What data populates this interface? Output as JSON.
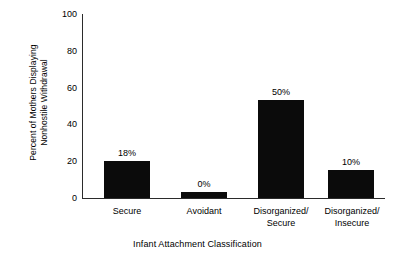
{
  "chart_data": {
    "type": "bar",
    "title": "",
    "xlabel": "Infant Attachment Classification",
    "ylabel": "Percent of Mothers Displaying Nonhostile Withdrawal",
    "ylabel_lines": [
      "Percent of Mothers Displaying",
      "Nonhostile Withdrawal"
    ],
    "categories": [
      "Secure",
      "Avoidant",
      "Disorganized/Secure",
      "Disorganized/Insecure"
    ],
    "category_lines": [
      [
        "Secure"
      ],
      [
        "Avoidant"
      ],
      [
        "Disorganized/",
        "Secure"
      ],
      [
        "Disorganized/",
        "Insecure"
      ]
    ],
    "values": [
      20,
      3,
      53,
      15
    ],
    "data_labels": [
      "18%",
      "0%",
      "50%",
      "10%"
    ],
    "ylim": [
      0,
      100
    ],
    "yticks": [
      0,
      20,
      40,
      60,
      80,
      100
    ],
    "ytick_labels": [
      "0",
      "20",
      "40",
      "60",
      "80",
      "100"
    ],
    "grid": false,
    "legend": "none",
    "bar_color": "#0b0b0b",
    "axis_color": "#2b2b2b",
    "background": "#ffffff"
  }
}
